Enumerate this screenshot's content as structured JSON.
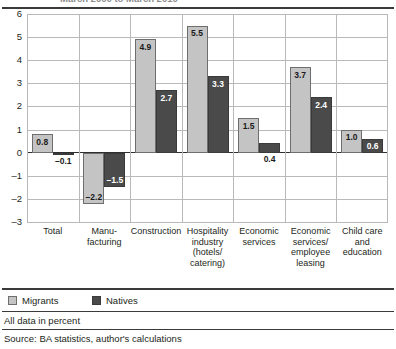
{
  "figure": {
    "title_clipped": "March 2000 to March 2010",
    "note": "All data in percent",
    "source": "Source: BA statistics, author's calculations"
  },
  "legend": {
    "position": "bottom-left",
    "items": [
      {
        "label": "Migrants",
        "color": "#c4c4c4"
      },
      {
        "label": "Natives",
        "color": "#4a4a4a"
      }
    ]
  },
  "axis": {
    "y_ticks": [
      "6",
      "5",
      "4",
      "3",
      "2",
      "1",
      "0",
      "–1",
      "–2",
      "–3"
    ]
  },
  "chart_data": {
    "type": "bar",
    "title": "March 2000 to March 2010",
    "xlabel": "",
    "ylabel": "",
    "ylim": [
      -3,
      6
    ],
    "ytick_values": [
      6,
      5,
      4,
      3,
      2,
      1,
      0,
      -1,
      -2,
      -3
    ],
    "grid": true,
    "legend_position": "bottom-left",
    "categories": [
      "Total",
      "Manu-\nfacturing",
      "Construction",
      "Hospitality\nindustry\n(hotels/\ncatering)",
      "Economic\nservices",
      "Economic\nservices/\nemployee\nleasing",
      "Child care\nand\neducation"
    ],
    "category_labels": [
      [
        "Total"
      ],
      [
        "Manu-",
        "facturing"
      ],
      [
        "Construction"
      ],
      [
        "Hospitality",
        "industry",
        "(hotels/",
        "catering)"
      ],
      [
        "Economic",
        "services"
      ],
      [
        "Economic",
        "services/",
        "employee",
        "leasing"
      ],
      [
        "Child care",
        "and",
        "education"
      ]
    ],
    "series": [
      {
        "name": "Migrants",
        "color": "#c4c4c4",
        "values": [
          0.8,
          -2.2,
          4.9,
          5.5,
          1.5,
          3.7,
          1.0
        ],
        "labels": [
          "0.8",
          "–2.2",
          "4.9",
          "5.5",
          "1.5",
          "3.7",
          "1.0"
        ]
      },
      {
        "name": "Natives",
        "color": "#4a4a4a",
        "values": [
          -0.1,
          -1.5,
          2.7,
          3.3,
          0.4,
          2.4,
          0.6
        ],
        "labels": [
          "–0.1",
          "–1.5",
          "2.7",
          "3.3",
          "0.4",
          "2.4",
          "0.6"
        ]
      }
    ],
    "unit": "percent"
  }
}
